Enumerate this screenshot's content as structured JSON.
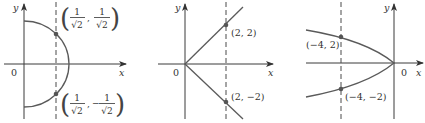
{
  "figure": {
    "panels": [
      {
        "id": "semicircle",
        "axis_labels": {
          "x": "x",
          "y": "y",
          "origin": "0"
        },
        "points": [
          {
            "num1": "1",
            "den1": "√2",
            "sep": ",",
            "num2": "1",
            "den2": "√2",
            "sign2": ""
          },
          {
            "num1": "1",
            "den1": "√2",
            "sep": ",",
            "num2": "1",
            "den2": "√2",
            "sign2": "−"
          }
        ]
      },
      {
        "id": "absolute-value-v",
        "axis_labels": {
          "x": "x",
          "y": "y",
          "origin": "0"
        },
        "points": [
          {
            "label": "(2, 2)"
          },
          {
            "label": "(2, −2)"
          }
        ]
      },
      {
        "id": "parabola-left",
        "axis_labels": {
          "x": "x",
          "y": "y",
          "origin": "0"
        },
        "points": [
          {
            "label": "(−4, 2)"
          },
          {
            "label": "(−4, −2)"
          }
        ]
      }
    ],
    "colors": {
      "axis": "#3a3a3a",
      "curve": "#5a5a5a",
      "dot": "#555555"
    }
  }
}
